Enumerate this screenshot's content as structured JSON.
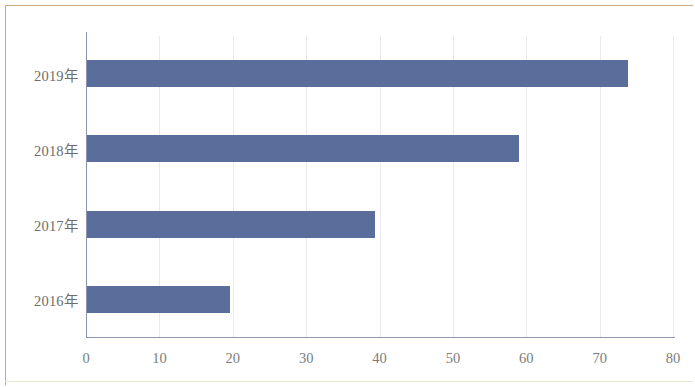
{
  "chart_data": {
    "type": "bar",
    "orientation": "horizontal",
    "title": "",
    "xlabel": "",
    "ylabel": "",
    "categories": [
      "2019年",
      "2018年",
      "2017年",
      "2016年"
    ],
    "values": [
      73.8,
      59.0,
      39.4,
      19.6
    ],
    "xlim": [
      0,
      80
    ],
    "xticks": [
      0,
      10,
      20,
      30,
      40,
      50,
      60,
      70,
      80
    ],
    "xtick_labels": [
      "0",
      "10",
      "20",
      "30",
      "40",
      "50",
      "60",
      "70",
      "80"
    ],
    "grid": true,
    "grid_axis": "x",
    "legend": false,
    "series": [
      {
        "name": "",
        "color": "#5b6e9b",
        "values": [
          73.8,
          59.0,
          39.4,
          19.6
        ]
      }
    ],
    "colors": {
      "bar": "#5b6e9b",
      "axis": "#8c93ad",
      "gridline": "#e9e9ee",
      "tick_text": "#7c7c7c",
      "category_text": "#6d6d6d",
      "frame": "#c9ab7c",
      "background": "#ffffff"
    }
  }
}
